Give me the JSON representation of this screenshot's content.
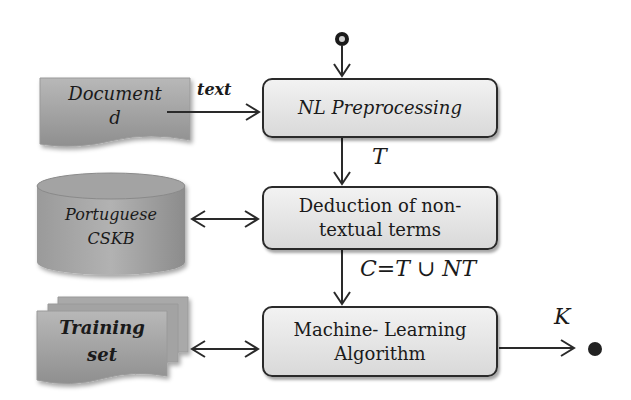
{
  "diagram": {
    "start_marker": "initial-node",
    "end_marker": "final-node",
    "inputs": {
      "document": {
        "line1": "Document",
        "line2": "d"
      },
      "cskb": {
        "line1": "Portuguese",
        "line2": "CSKB"
      },
      "training": {
        "line1": "Training",
        "line2": "set"
      }
    },
    "processes": {
      "nl": "NL Preprocessing",
      "deduction": {
        "line1": "Deduction of non-",
        "line2": "textual terms"
      },
      "ml": {
        "line1": "Machine- Learning",
        "line2": "Algorithm"
      }
    },
    "edge_labels": {
      "text": "text",
      "T": "T",
      "C": "C=T ∪ NT",
      "K": "K"
    },
    "colors": {
      "shape_fill": "#a6a6a6",
      "process_fill": "#e6e6e6",
      "stroke": "#2a2a2a"
    }
  }
}
